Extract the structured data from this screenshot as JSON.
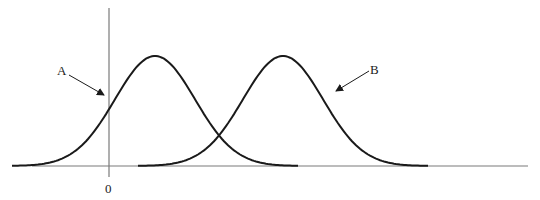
{
  "diagram": {
    "type": "two-normal-distributions",
    "colors": {
      "curve": "#1a1a1a",
      "axis": "#7a7a7a",
      "text": "#222222",
      "background": "#ffffff"
    },
    "axes": {
      "origin_label": "0"
    },
    "curves": [
      {
        "id": "A",
        "label": "A",
        "peak_x": 155,
        "start_x": 12,
        "end_x": 298
      },
      {
        "id": "B",
        "label": "B",
        "peak_x": 283,
        "start_x": 138,
        "end_x": 428
      }
    ]
  }
}
